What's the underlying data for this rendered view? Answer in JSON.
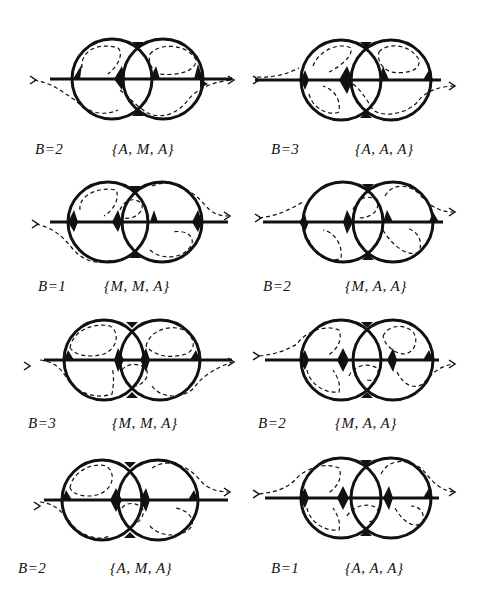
{
  "figure": {
    "panels": [
      {
        "b_label": "B=2",
        "set_label": "{A, M, A}",
        "top_left": "dashed",
        "top_right": "dashed",
        "variant": "v1",
        "exit": "right",
        "entry": "bottom-left"
      },
      {
        "b_label": "B=3",
        "set_label": "{A, A, A}",
        "variant": "v2"
      },
      {
        "b_label": "B=1",
        "set_label": "{M, M, A}",
        "variant": "v3"
      },
      {
        "b_label": "B=2",
        "set_label": "{M, A, A}",
        "variant": "v4"
      },
      {
        "b_label": "B=3",
        "set_label": "{M, M, A}",
        "variant": "v5"
      },
      {
        "b_label": "B=2",
        "set_label": "{M, A, A}",
        "variant": "v6"
      },
      {
        "b_label": "B=2",
        "set_label": "{A, M, A}",
        "variant": "v7"
      },
      {
        "b_label": "B=1",
        "set_label": "{A, A, A}",
        "variant": "v8"
      }
    ]
  }
}
